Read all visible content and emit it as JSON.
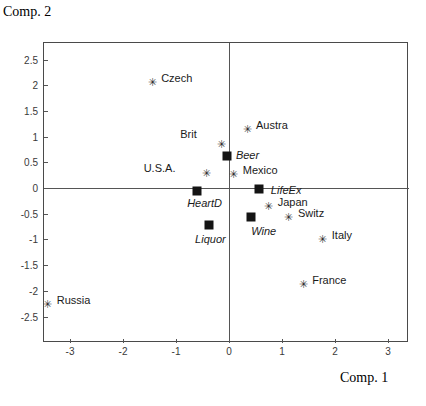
{
  "axis_titles": {
    "y": "Comp. 2",
    "x": "Comp. 1"
  },
  "chart_data": {
    "type": "scatter",
    "title": "",
    "subtitle": "",
    "xlabel": "Comp. 1",
    "ylabel": "Comp. 2",
    "xlim": [
      -3.5,
      3.5
    ],
    "ylim": [
      -2.75,
      2.75
    ],
    "grid": false,
    "legend": "none",
    "xticks": [
      "-3",
      "-2",
      "-1",
      "0",
      "1",
      "2",
      "3"
    ],
    "xtick_values": [
      -3,
      -2,
      -1,
      0,
      1,
      2,
      3
    ],
    "yticks": [
      "2.5",
      "2",
      "1.5",
      "1",
      "0.5",
      "0",
      "-0.5",
      "-1",
      "-1.5",
      "-2",
      "-2.5"
    ],
    "ytick_values": [
      2.5,
      2,
      1.5,
      1,
      0.5,
      0,
      -0.5,
      -1,
      -1.5,
      -2,
      -2.5
    ],
    "series": [
      {
        "name": "observations",
        "marker": "asterisk",
        "points": [
          {
            "label": "Czech",
            "x": -1.45,
            "y": 2.06,
            "lx": 0.17,
            "ly": 0.06
          },
          {
            "label": "Austra",
            "x": 0.34,
            "y": 1.15,
            "lx": 0.17,
            "ly": 0.06
          },
          {
            "label": "Brit",
            "x": -0.15,
            "y": 0.86,
            "lx": -0.77,
            "ly": 0.17
          },
          {
            "label": "Mexico",
            "x": 0.09,
            "y": 0.27,
            "lx": 0.17,
            "ly": 0.06
          },
          {
            "label": "U.S.A.",
            "x": -0.43,
            "y": 0.29,
            "lx": -1.18,
            "ly": 0.07
          },
          {
            "label": "Japan",
            "x": 0.75,
            "y": -0.35,
            "lx": 0.17,
            "ly": 0.06
          },
          {
            "label": "Switz",
            "x": 1.13,
            "y": -0.56,
            "lx": 0.17,
            "ly": 0.06
          },
          {
            "label": "Italy",
            "x": 1.77,
            "y": -0.99,
            "lx": 0.17,
            "ly": 0.06
          },
          {
            "label": "France",
            "x": 1.4,
            "y": -1.87,
            "lx": 0.17,
            "ly": 0.06
          },
          {
            "label": "Russia",
            "x": -3.42,
            "y": -2.26,
            "lx": 0.17,
            "ly": 0.06
          }
        ]
      },
      {
        "name": "variables",
        "marker": "square",
        "points": [
          {
            "label": "Beer",
            "x": -0.04,
            "y": 0.62,
            "lx": 0.17,
            "ly": 0.0
          },
          {
            "label": "HeartD",
            "x": -0.6,
            "y": -0.06,
            "lx": -0.19,
            "ly": -0.26
          },
          {
            "label": "LifeEx",
            "x": 0.57,
            "y": -0.02,
            "lx": 0.22,
            "ly": -0.03
          },
          {
            "label": "Wine",
            "x": 0.42,
            "y": -0.56,
            "lx": 0.0,
            "ly": -0.29
          },
          {
            "label": "Liquor",
            "x": -0.38,
            "y": -0.72,
            "lx": -0.26,
            "ly": -0.3
          }
        ]
      }
    ]
  }
}
